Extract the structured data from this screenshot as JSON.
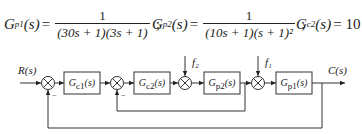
{
  "equations": {
    "gp1": {
      "lhs": "G",
      "sub": "p1",
      "arg": "(s)",
      "eq": "=",
      "num": "1",
      "den": "(30s + 1)(3s + 1)",
      "sep": ";"
    },
    "gp2": {
      "lhs": "G",
      "sub": "p2",
      "arg": "(s)",
      "eq": "=",
      "num": "1",
      "den": "(10s + 1)(s + 1)²",
      "sep": ";"
    },
    "gc2": {
      "lhs": "G",
      "sub": "c2",
      "arg": "(s)",
      "eq": "= 10"
    }
  },
  "diagram": {
    "input_label": "R(s)",
    "output_label": "C(s)",
    "disturbances": {
      "f2": "f₂",
      "f1": "f₁"
    },
    "blocks": [
      {
        "id": "gc1",
        "label": "Gc1(s)",
        "main": "G",
        "sub": "c1",
        "arg": "(s)"
      },
      {
        "id": "gc2",
        "label": "Gc2(s)",
        "main": "G",
        "sub": "c2",
        "arg": "(s)"
      },
      {
        "id": "gp2",
        "label": "Gp2(s)",
        "main": "G",
        "sub": "p2",
        "arg": "(s)"
      },
      {
        "id": "gp1",
        "label": "Gp1(s)",
        "main": "G",
        "sub": "p1",
        "arg": "(s)"
      }
    ],
    "feedback_signs": {
      "outer": "−",
      "inner": "−"
    }
  }
}
